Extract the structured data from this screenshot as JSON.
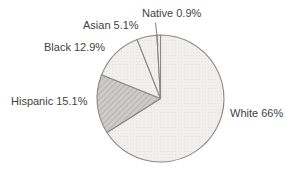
{
  "chart_data": {
    "type": "pie",
    "title": "",
    "legend": "none",
    "start_angle_deg": 0,
    "direction": "clockwise-from-top",
    "slices": [
      {
        "name": "white",
        "category": "White",
        "value": 66,
        "display": "White 66%",
        "pattern": "dots"
      },
      {
        "name": "hispanic",
        "category": "Hispanic",
        "value": 15.1,
        "display": "Hispanic 15.1%",
        "pattern": "hatch"
      },
      {
        "name": "black",
        "category": "Black",
        "value": 12.9,
        "display": "Black 12.9%",
        "pattern": "dots"
      },
      {
        "name": "asian",
        "category": "Asian",
        "value": 5.1,
        "display": "Asian 5.1%",
        "pattern": "dots"
      },
      {
        "name": "native",
        "category": "Native",
        "value": 0.9,
        "display": "Native 0.9%",
        "pattern": "dots"
      }
    ],
    "colors": {
      "light_bg": "#f1f0ee",
      "light_dot": "#e3e2df",
      "hatch_bg": "#cdccca",
      "hatch_line": "#b5b4b2",
      "stroke": "#8a8a8a",
      "leader_line": "#8a8a8a",
      "label_text": "#3f3f3f"
    }
  }
}
